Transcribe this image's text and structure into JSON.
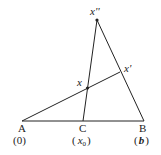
{
  "diagram": {
    "type": "geometry-triangle",
    "points": {
      "A": {
        "label": "A",
        "coord_label": "(0)"
      },
      "C": {
        "label": "C",
        "coord_label_open": "(",
        "coord_var": "x",
        "coord_sub": "0",
        "coord_label_close": ")"
      },
      "B": {
        "label": "B",
        "coord_label_open": "(",
        "coord_var": "b",
        "coord_label_close": ")"
      },
      "apex": {
        "label": "x''"
      },
      "x_prime": {
        "label": "x'"
      },
      "x": {
        "label": "x"
      }
    },
    "colors": {
      "line": "#222222",
      "text": "#222222"
    }
  }
}
